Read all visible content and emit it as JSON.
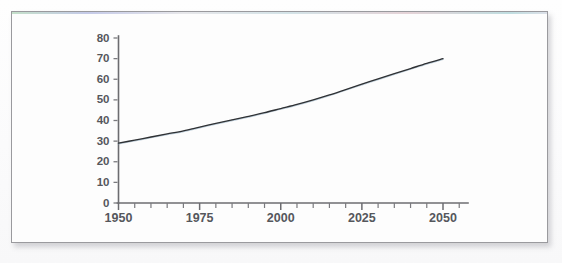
{
  "figure": {
    "card_name": "scanned-line-chart-card",
    "background_color": "#fdfdfd",
    "border_color": "#9a9a9e",
    "line_color": "#2f3134",
    "axis_color": "#6c6c70",
    "label_color": "#55575c"
  },
  "chart_data": {
    "type": "line",
    "title": "",
    "subtitle": "",
    "xlabel": "",
    "ylabel": "",
    "xlim": [
      1950,
      2055
    ],
    "ylim": [
      0,
      80
    ],
    "grid": false,
    "legend": "none",
    "x_ticks_major": [
      1950,
      1975,
      2000,
      2025,
      2050
    ],
    "x_tick_labels": [
      "1950",
      "1975",
      "2000",
      "2025",
      "2050"
    ],
    "x_minor_tick_step": 5,
    "y_ticks": [
      0,
      10,
      20,
      30,
      40,
      50,
      60,
      70,
      80
    ],
    "y_tick_labels": [
      "0",
      "10",
      "20",
      "30",
      "40",
      "50",
      "60",
      "70",
      "80"
    ],
    "series": [
      {
        "name": "world population",
        "color": "#2f3134",
        "x": [
          1950,
          1955,
          1960,
          1965,
          1970,
          1975,
          1980,
          1985,
          1990,
          1995,
          2000,
          2005,
          2010,
          2015,
          2020,
          2025,
          2030,
          2035,
          2040,
          2045,
          2050
        ],
        "values": [
          29,
          30.5,
          32,
          33.5,
          35,
          36.8,
          38.6,
          40.3,
          42,
          43.8,
          45.8,
          47.8,
          50,
          52.4,
          55,
          57.6,
          60.2,
          62.7,
          65.2,
          67.7,
          70
        ]
      }
    ],
    "annotations": []
  }
}
